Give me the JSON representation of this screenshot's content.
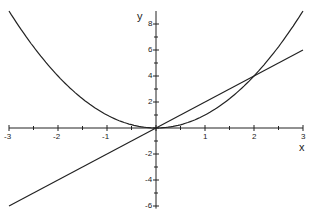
{
  "chart_data": {
    "type": "line",
    "title": "",
    "xlabel": "x",
    "ylabel": "y",
    "xlim": [
      -3,
      3
    ],
    "ylim": [
      -6,
      9
    ],
    "x_ticks": [
      "-3",
      "-2",
      "-1",
      "1",
      "2",
      "3"
    ],
    "y_ticks": [
      "8",
      "6",
      "4",
      "2",
      "-2",
      "-4",
      "-6"
    ],
    "grid": false,
    "series": [
      {
        "name": "y = x^2",
        "x": [
          -3,
          -2,
          -1,
          0,
          1,
          2,
          3
        ],
        "values": [
          9,
          4,
          1,
          0,
          1,
          4,
          9
        ]
      },
      {
        "name": "y = 2x",
        "x": [
          -3,
          0,
          3
        ],
        "values": [
          -6,
          0,
          6
        ]
      }
    ],
    "intersections": [
      [
        0,
        0
      ],
      [
        2,
        4
      ]
    ]
  }
}
